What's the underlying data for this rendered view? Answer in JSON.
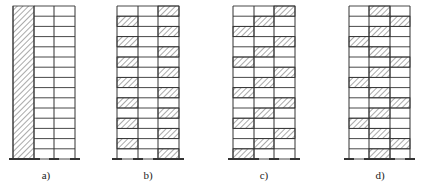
{
  "diagram": {
    "stories": 15,
    "bays": 3,
    "colors": {
      "line": "#333333",
      "hatch": "#555555",
      "background": "#ffffff"
    },
    "frames": [
      {
        "id": "a",
        "label": "a)",
        "type": "full-height wall",
        "wall_column": true,
        "hatched_cells": []
      },
      {
        "id": "b",
        "label": "b)",
        "type": "alternating wall panels",
        "wall_column": false,
        "hatched_cells": [
          "R",
          "L",
          "R",
          "L",
          "R",
          "L",
          "R",
          "L",
          "R",
          "L",
          "R",
          "L",
          "R",
          "L",
          "R"
        ]
      },
      {
        "id": "c",
        "label": "c)",
        "type": "staggered wall panels",
        "wall_column": false,
        "hatched_cells": [
          "R",
          "M",
          "L",
          "R",
          "M",
          "L",
          "R",
          "M",
          "L",
          "R",
          "M",
          "L",
          "R",
          "M",
          "L"
        ]
      },
      {
        "id": "d",
        "label": "d)",
        "type": "staggered wall panels",
        "wall_column": false,
        "hatched_cells": [
          "M",
          "R",
          "M",
          "L",
          "M",
          "R",
          "M",
          "L",
          "M",
          "R",
          "M",
          "L",
          "M",
          "R",
          "M"
        ]
      }
    ]
  }
}
